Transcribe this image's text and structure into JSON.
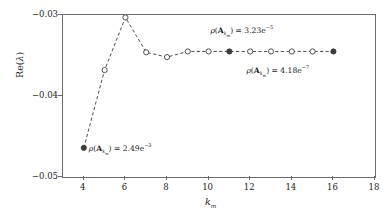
{
  "chart_data": {
    "type": "line",
    "title": "",
    "xlabel": "k_m",
    "ylabel": "Re(lambda)",
    "xlim": [
      3,
      18
    ],
    "ylim": [
      -0.05,
      -0.03
    ],
    "grid": false,
    "legend": null,
    "x": [
      4,
      5,
      6,
      7,
      8,
      9,
      10,
      11,
      12,
      13,
      14,
      15,
      16
    ],
    "values": [
      -0.0464,
      -0.0368,
      -0.0303,
      -0.0346,
      -0.0352,
      -0.0345,
      -0.0345,
      -0.0345,
      -0.0345,
      -0.0345,
      -0.0345,
      -0.0345,
      -0.0345
    ],
    "marker_filled": [
      true,
      false,
      false,
      false,
      false,
      false,
      false,
      true,
      false,
      false,
      false,
      false,
      true
    ],
    "linestyle": "dashed",
    "marker": "circle",
    "xticks": [
      4,
      6,
      8,
      10,
      12,
      14,
      16,
      18
    ],
    "xtick_labels": [
      "4",
      "6",
      "8",
      "10",
      "12",
      "14",
      "16",
      "18"
    ],
    "yticks": [
      -0.05,
      -0.04,
      -0.03
    ],
    "ytick_labels": [
      "−0.05",
      "−0.04",
      "−0.03"
    ],
    "annotations": [
      {
        "name": "rho-kmin",
        "x": 4,
        "y": -0.0464,
        "text_value": "2.49e−3",
        "symbol_rho": "ρ",
        "symbol_matrix": "A",
        "symbol_sub": "k",
        "symbol_sub2": "m",
        "equals": "="
      },
      {
        "name": "rho-mid",
        "x": 11,
        "y": -0.0345,
        "text_value": "3.23e−5",
        "symbol_rho": "ρ",
        "symbol_matrix": "A",
        "symbol_sub": "k",
        "symbol_sub2": "m",
        "equals": "="
      },
      {
        "name": "rho-kmax",
        "x": 16,
        "y": -0.0345,
        "text_value": "4.18e−7",
        "symbol_rho": "ρ",
        "symbol_matrix": "A",
        "symbol_sub": "k",
        "symbol_sub2": "m",
        "equals": "="
      }
    ]
  },
  "axes": {
    "y_title_prefix": "Re(",
    "y_title_var": "λ",
    "y_title_suffix": ")",
    "x_title_var": "k",
    "x_title_sub": "m"
  },
  "style": {
    "line_color": "#4a4a4a",
    "marker_edge": "#3c3c3c",
    "marker_fill_open": "#ffffff",
    "marker_fill_closed": "#3c3c3c",
    "axis_color": "#6b6b6b",
    "text_color": "#1a1a1a",
    "background": "#ffffff"
  }
}
